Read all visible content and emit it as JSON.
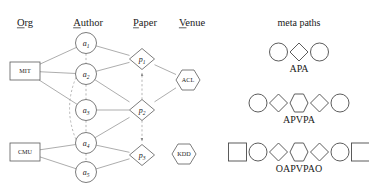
{
  "diagram": {
    "columns": [
      {
        "label": "Org",
        "underlined_prefix": "O",
        "x": 25,
        "y": 26
      },
      {
        "label": "Author",
        "underlined_prefix": "A",
        "x": 88,
        "y": 26
      },
      {
        "label": "Paper",
        "underlined_prefix": "P",
        "x": 145,
        "y": 26
      },
      {
        "label": "Venue",
        "underlined_prefix": "V",
        "x": 192,
        "y": 26
      }
    ],
    "org_nodes": [
      {
        "id": "MIT",
        "label": "MIT",
        "shape": "rect",
        "x": 25,
        "y": 71
      },
      {
        "id": "CMU",
        "label": "CMU",
        "shape": "rect",
        "x": 25,
        "y": 152
      }
    ],
    "author_nodes": [
      {
        "id": "a1",
        "label": "a",
        "sub": "1",
        "shape": "circle",
        "x": 86,
        "y": 43
      },
      {
        "id": "a2",
        "label": "a",
        "sub": "2",
        "shape": "circle",
        "x": 86,
        "y": 74
      },
      {
        "id": "a3",
        "label": "a",
        "sub": "3",
        "shape": "circle",
        "x": 86,
        "y": 110
      },
      {
        "id": "a4",
        "label": "a",
        "sub": "4",
        "shape": "circle",
        "x": 86,
        "y": 143
      },
      {
        "id": "a5",
        "label": "a",
        "sub": "5",
        "shape": "circle",
        "x": 86,
        "y": 172
      }
    ],
    "paper_nodes": [
      {
        "id": "p1",
        "label": "p",
        "sub": "1",
        "shape": "diamond",
        "x": 142,
        "y": 59
      },
      {
        "id": "p2",
        "label": "p",
        "sub": "2",
        "shape": "diamond",
        "x": 142,
        "y": 110
      },
      {
        "id": "p3",
        "label": "p",
        "sub": "3",
        "shape": "diamond",
        "x": 142,
        "y": 155
      }
    ],
    "venue_nodes": [
      {
        "id": "ACL",
        "label": "ACL",
        "shape": "hexagon",
        "x": 188,
        "y": 80
      },
      {
        "id": "KDD",
        "label": "KDD",
        "shape": "hexagon",
        "x": 184,
        "y": 154
      }
    ],
    "solid_edges": [
      {
        "from": "MIT",
        "to": "a1"
      },
      {
        "from": "MIT",
        "to": "a2"
      },
      {
        "from": "MIT",
        "to": "a3"
      },
      {
        "from": "CMU",
        "to": "a4"
      },
      {
        "from": "CMU",
        "to": "a5"
      },
      {
        "from": "a1",
        "to": "p1"
      },
      {
        "from": "a2",
        "to": "p1"
      },
      {
        "from": "a2",
        "to": "p2"
      },
      {
        "from": "a3",
        "to": "p2"
      },
      {
        "from": "a4",
        "to": "p2"
      },
      {
        "from": "a4",
        "to": "p3"
      },
      {
        "from": "a5",
        "to": "p3"
      },
      {
        "from": "p1",
        "to": "ACL"
      },
      {
        "from": "p2",
        "to": "ACL"
      }
    ],
    "dashed_edges": [
      {
        "from": "a1",
        "to": "a2",
        "arrow": false
      },
      {
        "from": "a2",
        "to": "a3",
        "arrow": false
      },
      {
        "from": "a3",
        "to": "a4",
        "arrow": false
      },
      {
        "from": "a4",
        "to": "a5",
        "arrow": false
      },
      {
        "from": "a2",
        "to": "a4",
        "arrow": false,
        "curved": true
      },
      {
        "from": "p2",
        "to": "p1",
        "arrow": true
      },
      {
        "from": "p2",
        "to": "p3",
        "arrow": true
      }
    ]
  },
  "meta_paths": {
    "title": "meta paths",
    "title_x": 299,
    "title_y": 26,
    "rows": [
      {
        "caption": "APA",
        "shapes": [
          "circle",
          "diamond",
          "circle"
        ],
        "center_x": 299,
        "shapes_y": 52,
        "caption_y": 72
      },
      {
        "caption": "APVPA",
        "shapes": [
          "circle",
          "diamond",
          "hexagon",
          "diamond",
          "circle"
        ],
        "center_x": 299,
        "shapes_y": 103,
        "caption_y": 123
      },
      {
        "caption": "OAPVPAO",
        "shapes": [
          "square",
          "circle",
          "diamond",
          "hexagon",
          "diamond",
          "circle",
          "square"
        ],
        "center_x": 299,
        "shapes_y": 152,
        "caption_y": 172
      }
    ]
  },
  "colors": {
    "node_stroke": "#5a5a5a",
    "edge_solid": "#8a8a8a",
    "edge_dashed": "#9a9a9a",
    "text": "#1a1a1a",
    "background": "#ffffff"
  }
}
